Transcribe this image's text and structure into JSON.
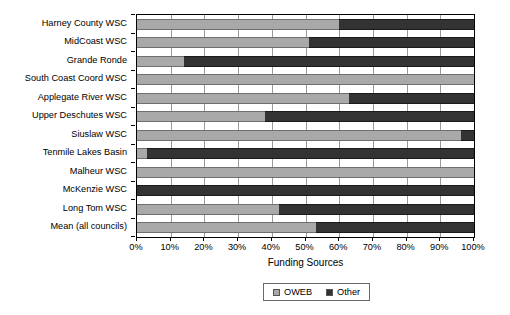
{
  "chart_data": {
    "type": "bar",
    "orientation": "horizontal",
    "stacked": true,
    "stack_total": 100,
    "title": "",
    "xlabel": "Funding Sources",
    "ylabel": "",
    "xlim": [
      0,
      100
    ],
    "xticks": [
      "0%",
      "10%",
      "20%",
      "30%",
      "40%",
      "50%",
      "60%",
      "70%",
      "80%",
      "90%",
      "100%"
    ],
    "xtick_values": [
      0,
      10,
      20,
      30,
      40,
      50,
      60,
      70,
      80,
      90,
      100
    ],
    "grid": "vertical",
    "legend_position": "bottom-center",
    "categories": [
      "Harney County WSC",
      "MidCoast WSC",
      "Grande Ronde",
      "South Coast Coord WSC",
      "Applegate River WSC",
      "Upper Deschutes WSC",
      "Siuslaw WSC",
      "Tenmile Lakes Basin",
      "Malheur WSC",
      "McKenzie WSC",
      "Long Tom WSC",
      "Mean (all councils)"
    ],
    "series": [
      {
        "name": "OWEB",
        "color": "#a9a9a9",
        "values": [
          60,
          51,
          14,
          100,
          63,
          38,
          96,
          3,
          100,
          0,
          42,
          53
        ]
      },
      {
        "name": "Other",
        "color": "#333333",
        "values": [
          40,
          49,
          86,
          0,
          37,
          62,
          4,
          97,
          0,
          100,
          58,
          47
        ]
      }
    ],
    "legend": [
      "OWEB",
      "Other"
    ]
  },
  "colors": {
    "oweb": "#a9a9a9",
    "other": "#333333",
    "gridline": "#9a9a9a",
    "axis": "#000000",
    "background": "#ffffff"
  }
}
